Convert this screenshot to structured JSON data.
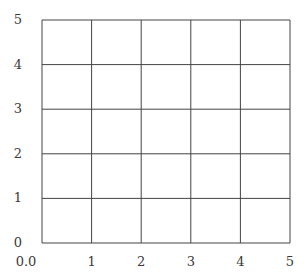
{
  "diagram": {
    "type": "empty coordinate grid",
    "grid_color": "#444444",
    "background": "#ffffff",
    "x_range": [
      0,
      5
    ],
    "y_range": [
      0,
      5
    ],
    "x_divisions": 5,
    "y_divisions": 5,
    "x_tick_labels": [
      "0.0",
      "1",
      "2",
      "3",
      "4",
      "5"
    ],
    "y_tick_labels": [
      "0",
      "1",
      "2",
      "3",
      "4",
      "5"
    ]
  },
  "layout": {
    "left": 42,
    "right": 290,
    "top": 20,
    "bottom": 243
  }
}
